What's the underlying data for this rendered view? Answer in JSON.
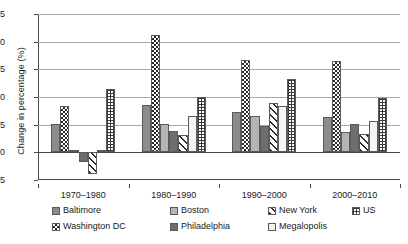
{
  "chart_data": {
    "type": "bar",
    "title": "",
    "xlabel": "",
    "ylabel": "Change in percentage (%)",
    "categories": [
      "1970–1980",
      "1980–1990",
      "1990–2000",
      "2000–2010"
    ],
    "ylim": [
      -5,
      25
    ],
    "yticks": [
      -5,
      0,
      5,
      10,
      15,
      20,
      25
    ],
    "ytick_labels": [
      "-5",
      "0",
      "5",
      "10",
      "15",
      "20",
      "25"
    ],
    "grid": true,
    "legend_position": "bottom",
    "series": [
      {
        "name": "Baltimore",
        "pattern": "solid-mid",
        "values": [
          5.2,
          8.6,
          7.2,
          6.3
        ]
      },
      {
        "name": "Washington DC",
        "pattern": "checker",
        "values": [
          8.4,
          21.2,
          16.6,
          16.5
        ]
      },
      {
        "name": "Boston",
        "pattern": "solid-light",
        "values": [
          0.4,
          5.1,
          6.6,
          3.7
        ]
      },
      {
        "name": "Philadelphia",
        "pattern": "solid-dark",
        "values": [
          -1.7,
          3.9,
          4.7,
          5.2
        ]
      },
      {
        "name": "New York",
        "pattern": "diagonal",
        "values": [
          -4.0,
          3.1,
          8.9,
          3.3
        ]
      },
      {
        "name": "Megalopolis",
        "pattern": "white",
        "values": [
          0.4,
          6.6,
          8.3,
          5.7
        ]
      },
      {
        "name": "US",
        "pattern": "dotted",
        "values": [
          11.4,
          10.0,
          13.2,
          9.9
        ]
      }
    ]
  },
  "legend": {
    "row1": [
      "Baltimore",
      "Boston",
      "New York",
      "US"
    ],
    "row2": [
      "Washington DC",
      "Philadelphia",
      "Megalopolis"
    ]
  }
}
